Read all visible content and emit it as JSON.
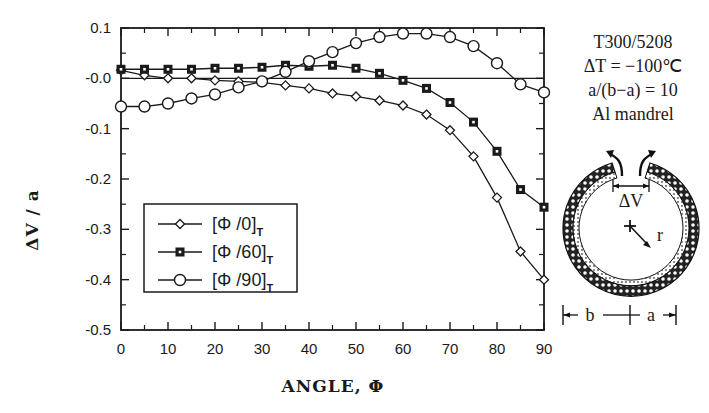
{
  "chart_data": {
    "type": "line",
    "title": "",
    "xlabel": "ANGLE, Φ",
    "ylabel": "ΔV / a",
    "xlim": [
      0,
      90
    ],
    "ylim": [
      -0.5,
      0.1
    ],
    "xticks": [
      0,
      10,
      20,
      30,
      40,
      50,
      60,
      70,
      80,
      90
    ],
    "yticks": [
      0.1,
      0.0,
      -0.1,
      -0.2,
      -0.3,
      -0.4,
      -0.5
    ],
    "ytick_labels": [
      "0.1",
      "-0.0",
      "-0.1",
      "-0.2",
      "-0.3",
      "-0.4",
      "-0.5"
    ],
    "grid": false,
    "zero_line": true,
    "legend_position": "lower left (inside plot)",
    "x": [
      0,
      5,
      10,
      15,
      20,
      25,
      30,
      35,
      40,
      45,
      50,
      55,
      60,
      65,
      70,
      75,
      80,
      85,
      90
    ],
    "series": [
      {
        "name": "[Φ/0]T",
        "label_main": "[Φ /0]",
        "label_sub": "T",
        "marker": "diamond",
        "values": [
          0.016,
          0.006,
          0.0,
          0.0,
          -0.004,
          -0.006,
          -0.008,
          -0.014,
          -0.02,
          -0.03,
          -0.036,
          -0.044,
          -0.054,
          -0.072,
          -0.103,
          -0.155,
          -0.237,
          -0.344,
          -0.4
        ]
      },
      {
        "name": "[Φ/60]T",
        "label_main": "[Φ /60]",
        "label_sub": "T",
        "marker": "square",
        "values": [
          0.018,
          0.018,
          0.018,
          0.018,
          0.02,
          0.02,
          0.022,
          0.026,
          0.024,
          0.026,
          0.02,
          0.01,
          -0.004,
          -0.02,
          -0.048,
          -0.087,
          -0.145,
          -0.221,
          -0.256
        ]
      },
      {
        "name": "[Φ/90]T",
        "label_main": "[Φ /90]",
        "label_sub": "T",
        "marker": "circle",
        "values": [
          -0.056,
          -0.056,
          -0.05,
          -0.04,
          -0.032,
          -0.018,
          -0.006,
          0.013,
          0.034,
          0.052,
          0.07,
          0.082,
          0.089,
          0.089,
          0.082,
          0.064,
          0.03,
          -0.012,
          -0.028
        ]
      }
    ],
    "annotations": [
      "T300/5208",
      "ΔT = −100℃",
      "a/(b−a) = 10",
      "Al mandrel"
    ]
  },
  "diagram": {
    "gap_label": "ΔV",
    "radius_label": "r",
    "dim_b": "b",
    "dim_a": "a"
  },
  "colors": {
    "ink": "#1a1a1a",
    "background": "#ffffff"
  }
}
